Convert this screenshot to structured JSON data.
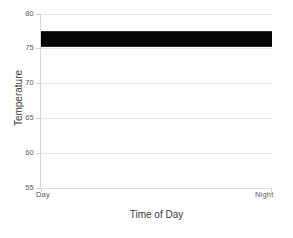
{
  "chart_data": {
    "type": "line",
    "title": "",
    "xlabel": "Time of Day",
    "ylabel": "Temperature",
    "xlim": [
      0,
      1
    ],
    "ylim": [
      55,
      80
    ],
    "grid": true,
    "legend": null,
    "x_tick_labels": [
      "Day",
      "Night"
    ],
    "y_tick_labels": [
      "55",
      "60",
      "65",
      "70",
      "75",
      "80"
    ],
    "y_ticks": [
      55,
      60,
      65,
      70,
      75,
      80
    ],
    "series": [
      {
        "name": "Temperature",
        "color": "#050505",
        "description": "Dense high-frequency noisy temperature trace spanning the full Day-to-Night range, oscillating within a narrow band",
        "y_min": 75.2,
        "y_max": 77.5,
        "y_mean": 76.4,
        "values": [
          76.3,
          77.1,
          75.4,
          76.9,
          75.8,
          77.4,
          75.3,
          76.6,
          77.2,
          75.6,
          76.1,
          77.5,
          75.5,
          76.8,
          75.9,
          77.0,
          75.2,
          76.4,
          77.3,
          75.7,
          76.2,
          77.1,
          75.4,
          76.7,
          76.0,
          77.4,
          75.6,
          76.5,
          77.2,
          75.3,
          76.9,
          75.8,
          77.0,
          76.1,
          75.5,
          76.6,
          77.3,
          75.9,
          76.3,
          77.5,
          75.2,
          76.8,
          76.4,
          75.7,
          77.1,
          76.0,
          75.4,
          76.7,
          77.2,
          75.6,
          76.5,
          77.0,
          75.3,
          76.2,
          76.9,
          75.8,
          77.4,
          76.1,
          75.5,
          76.6,
          77.3,
          75.9,
          76.4,
          75.2,
          77.1,
          76.7,
          76.0,
          75.6,
          77.5,
          76.3,
          75.4,
          76.8,
          77.0,
          75.7,
          76.5,
          76.2,
          77.2,
          75.3,
          76.9,
          75.8,
          77.3,
          76.1,
          75.5,
          76.6,
          77.4,
          75.9,
          76.4,
          76.0,
          75.2,
          77.1,
          76.7,
          75.6,
          76.3,
          77.5,
          75.4,
          76.8,
          76.2,
          77.0,
          75.7,
          76.5
        ]
      }
    ]
  },
  "axes": {
    "x_title": "Time of Day",
    "y_title": "Temperature"
  }
}
